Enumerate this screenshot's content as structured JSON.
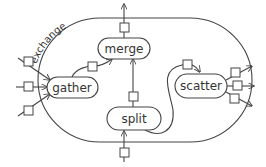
{
  "diagram": {
    "container": {
      "label": "exchange"
    },
    "nodes": [
      {
        "id": "merge",
        "label": "merge"
      },
      {
        "id": "gather",
        "label": "gather"
      },
      {
        "id": "scatter",
        "label": "scatter"
      },
      {
        "id": "split",
        "label": "split"
      }
    ],
    "edges": [
      {
        "from": "external-left-1",
        "to": "gather"
      },
      {
        "from": "external-left-2",
        "to": "gather"
      },
      {
        "from": "external-left-3",
        "to": "gather"
      },
      {
        "from": "gather",
        "to": "merge"
      },
      {
        "from": "split",
        "to": "merge"
      },
      {
        "from": "merge",
        "to": "external-top"
      },
      {
        "from": "external-bottom",
        "to": "split"
      },
      {
        "from": "split",
        "to": "scatter"
      },
      {
        "from": "scatter",
        "to": "external-right-1"
      },
      {
        "from": "scatter",
        "to": "external-right-2"
      },
      {
        "from": "scatter",
        "to": "external-right-3"
      }
    ],
    "colors": {
      "stroke": "#444444",
      "fill": "#ffffff",
      "text": "#333333"
    }
  }
}
